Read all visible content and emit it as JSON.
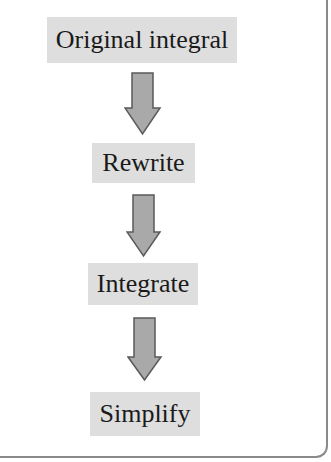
{
  "diagram": {
    "type": "flowchart",
    "direction": "top-to-bottom",
    "clipped_top_text": "",
    "steps": [
      {
        "label": "Original integral"
      },
      {
        "label": "Rewrite"
      },
      {
        "label": "Integrate"
      },
      {
        "label": "Simplify"
      }
    ],
    "connectors": [
      {
        "from": 0,
        "to": 1,
        "icon": "down-arrow-icon"
      },
      {
        "from": 1,
        "to": 2,
        "icon": "down-arrow-icon"
      },
      {
        "from": 2,
        "to": 3,
        "icon": "down-arrow-icon"
      }
    ],
    "colors": {
      "box_fill": "#dedede",
      "arrow_fill": "#a9a9a9",
      "arrow_stroke": "#5a5a5a",
      "frame_border": "#8a8a8a",
      "text": "#1a1a1a"
    }
  }
}
